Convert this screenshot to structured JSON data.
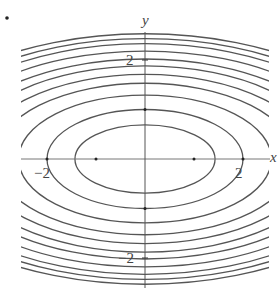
{
  "figure": {
    "marker": "•",
    "axes": {
      "x_label": "x",
      "y_label": "y"
    },
    "ticks": {
      "x_neg": "−2",
      "x_pos": "2",
      "y_pos": "2",
      "y_neg": "−2"
    }
  },
  "chart_data": {
    "type": "contour",
    "title": "",
    "xlabel": "x",
    "ylabel": "y",
    "xlim": [
      -2.5,
      2.5
    ],
    "ylim": [
      -2.6,
      2.6
    ],
    "grid": false,
    "legend": null,
    "contour_levels_semi_axis_y": [
      0.69,
      1.0,
      1.29,
      1.53,
      1.71,
      1.88,
      2.02,
      2.18,
      2.33,
      2.43,
      2.53
    ],
    "contour_levels_semi_axis_x": [
      1.43,
      2.0,
      2.58,
      3.06,
      3.42,
      3.76,
      4.04,
      4.36,
      4.66,
      4.86,
      5.06
    ],
    "x_ticks": [
      -2,
      2
    ],
    "y_ticks": [
      -2,
      2
    ],
    "marked_points": [
      [
        -1,
        0
      ],
      [
        1,
        0
      ],
      [
        0,
        1
      ],
      [
        0,
        -1
      ],
      [
        -2,
        0
      ],
      [
        2,
        0
      ]
    ],
    "colors": {
      "curves": "#555555",
      "axes": "#666666",
      "background": "#ffffff"
    }
  }
}
